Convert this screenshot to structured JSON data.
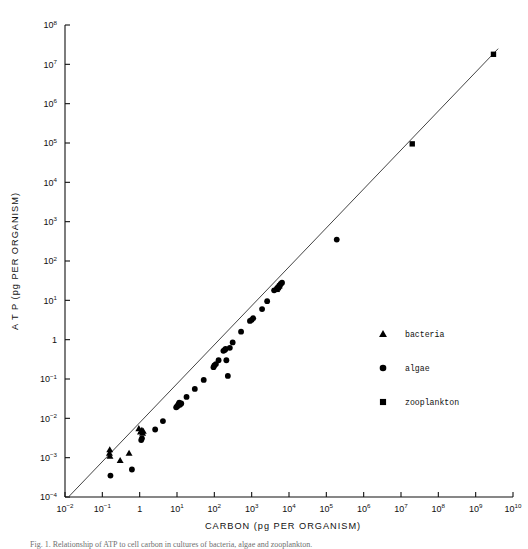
{
  "figure": {
    "caption": "Fig. 1. Relationship of ATP to cell carbon in cultures of bacteria, algae and zooplankton."
  },
  "axes": {
    "x": {
      "title": "CARBON",
      "units": "(pg PER ORGANISM)",
      "scale": "log10",
      "min_exp": -2,
      "max_exp": 10,
      "tick_labels": [
        "10-2",
        "10-1",
        "1",
        "101",
        "102",
        "103",
        "104",
        "105",
        "106",
        "107",
        "108",
        "109",
        "1010"
      ]
    },
    "y": {
      "title": "A T P",
      "units": "(pg PER ORGANISM)",
      "scale": "log10",
      "min_exp": -4,
      "max_exp": 8,
      "tick_labels": [
        "10-4",
        "10-3",
        "10-2",
        "10-1",
        "1",
        "101",
        "102",
        "103",
        "104",
        "105",
        "106",
        "107",
        "108"
      ]
    }
  },
  "legend": {
    "items": [
      {
        "marker": "triangle",
        "label": "bacteria"
      },
      {
        "marker": "circle",
        "label": "algae"
      },
      {
        "marker": "square",
        "label": "zooplankton"
      }
    ]
  },
  "chart_data": {
    "type": "scatter",
    "title": "",
    "xlabel": "CARBON (pg PER ORGANISM)",
    "ylabel": "ATP (pg PER ORGANISM)",
    "xscale": "log",
    "yscale": "log",
    "xlim": [
      0.01,
      10000000000
    ],
    "ylim": [
      0.0001,
      100000000
    ],
    "grid": false,
    "legend_position": "right-middle",
    "fit_line": {
      "label": "regression line",
      "x": [
        0.013,
        4000000000
      ],
      "y": [
        0.000105,
        25000000
      ]
    },
    "series": [
      {
        "name": "bacteria",
        "marker": "triangle",
        "x": [
          0.155,
          0.158,
          0.16,
          0.3,
          0.52,
          0.95,
          1.05,
          1.1,
          1.15,
          1.2,
          1.25
        ],
        "y": [
          0.0013,
          0.0016,
          0.0011,
          0.00085,
          0.0013,
          0.0055,
          0.0045,
          0.0048,
          0.005,
          0.0042,
          0.0047
        ]
      },
      {
        "name": "algae",
        "marker": "circle",
        "x": [
          0.165,
          0.62,
          1.1,
          1.15,
          2.6,
          4.2,
          9.5,
          10.0,
          10.5,
          11.0,
          11.5,
          12.0,
          13.0,
          18.0,
          30.0,
          52.0,
          95.0,
          100.0,
          110.0,
          130.0,
          175.0,
          190.0,
          200.0,
          210.0,
          230.0,
          260.0,
          310.0,
          520.0,
          900.0,
          1000.0,
          1100.0,
          1900.0,
          2600.0,
          4000.0,
          4800.0,
          5200.0,
          5600.0,
          6000.0,
          6500.0,
          190000.0
        ],
        "y": [
          0.00035,
          0.0005,
          0.0028,
          0.0031,
          0.0052,
          0.0085,
          0.019,
          0.02,
          0.021,
          0.023,
          0.025,
          0.022,
          0.024,
          0.035,
          0.056,
          0.095,
          0.2,
          0.22,
          0.24,
          0.3,
          0.52,
          0.55,
          0.58,
          0.3,
          0.12,
          0.62,
          0.85,
          1.6,
          3.0,
          3.2,
          3.5,
          6.0,
          9.5,
          18.0,
          20.0,
          22.0,
          24.0,
          26.0,
          28.0,
          350.0
        ]
      },
      {
        "name": "zooplankton",
        "marker": "square",
        "x": [
          4800.0,
          5200.0,
          5600.0,
          20000000.0,
          3000000000.0
        ],
        "y": [
          19.0,
          21.0,
          23.0,
          95000.0,
          18000000.0
        ]
      }
    ]
  }
}
